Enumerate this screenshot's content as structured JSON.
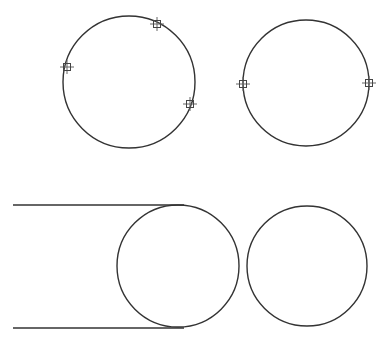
{
  "canvas": {
    "width": 387,
    "height": 345,
    "background": "#ffffff",
    "stroke": "#333333"
  },
  "figures": [
    {
      "name": "circle-three-points",
      "circle": {
        "cx": 129,
        "cy": 82,
        "r": 66
      },
      "markers": [
        {
          "x": 67,
          "y": 67
        },
        {
          "x": 157,
          "y": 24
        },
        {
          "x": 190,
          "y": 104
        }
      ]
    },
    {
      "name": "circle-two-points",
      "circle": {
        "cx": 306,
        "cy": 83,
        "r": 63
      },
      "markers": [
        {
          "x": 243,
          "y": 84
        },
        {
          "x": 369,
          "y": 83
        }
      ]
    },
    {
      "name": "circle-tangent-lines",
      "circle": {
        "cx": 178,
        "cy": 266,
        "r": 61
      },
      "lines": [
        {
          "x1": 13,
          "y1": 205,
          "x2": 184,
          "y2": 205
        },
        {
          "x1": 13,
          "y1": 328,
          "x2": 184,
          "y2": 328
        }
      ]
    },
    {
      "name": "circle-plain",
      "circle": {
        "cx": 307,
        "cy": 266,
        "r": 60
      }
    }
  ]
}
